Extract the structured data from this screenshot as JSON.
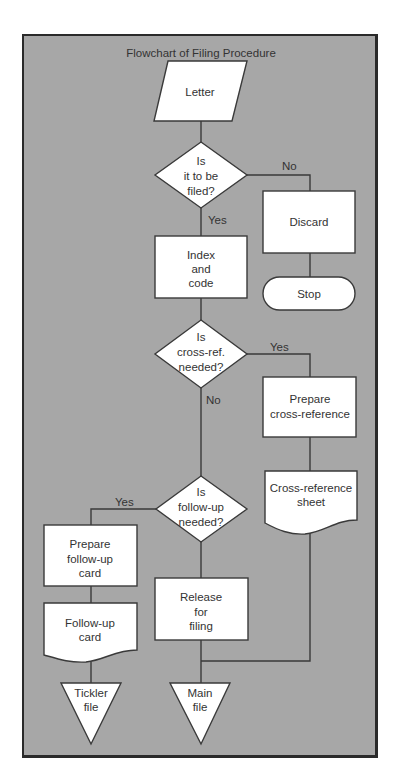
{
  "title": "Flowchart of Filing Procedure",
  "colors": {
    "background": "#a7a7a7",
    "shape_fill": "#ffffff",
    "stroke": "#3a3a3a",
    "text": "#333333"
  },
  "nodes": {
    "letter": {
      "type": "input-output",
      "lines": [
        "Letter"
      ]
    },
    "is_filed": {
      "type": "decision",
      "lines": [
        "Is",
        "it to be",
        "filed?"
      ]
    },
    "discard": {
      "type": "process",
      "lines": [
        "Discard"
      ]
    },
    "stop": {
      "type": "terminator",
      "lines": [
        "Stop"
      ]
    },
    "index_code": {
      "type": "process",
      "lines": [
        "Index",
        "and",
        "code"
      ]
    },
    "crossref_needed": {
      "type": "decision",
      "lines": [
        "Is",
        "cross-ref.",
        "needed?"
      ]
    },
    "prepare_crossref": {
      "type": "process",
      "lines": [
        "Prepare",
        "cross-reference"
      ]
    },
    "crossref_sheet": {
      "type": "document",
      "lines": [
        "Cross-reference",
        "sheet"
      ]
    },
    "followup_needed": {
      "type": "decision",
      "lines": [
        "Is",
        "follow-up",
        "needed?"
      ]
    },
    "prepare_followup": {
      "type": "process",
      "lines": [
        "Prepare",
        "follow-up",
        "card"
      ]
    },
    "followup_card": {
      "type": "document",
      "lines": [
        "Follow-up",
        "card"
      ]
    },
    "release": {
      "type": "process",
      "lines": [
        "Release",
        "for",
        "filing"
      ]
    },
    "tickler_file": {
      "type": "storage",
      "lines": [
        "Tickler",
        "file"
      ]
    },
    "main_file": {
      "type": "storage",
      "lines": [
        "Main",
        "file"
      ]
    }
  },
  "edge_labels": {
    "filed_no": "No",
    "filed_yes": "Yes",
    "crossref_yes": "Yes",
    "crossref_no": "No",
    "followup_yes": "Yes"
  }
}
